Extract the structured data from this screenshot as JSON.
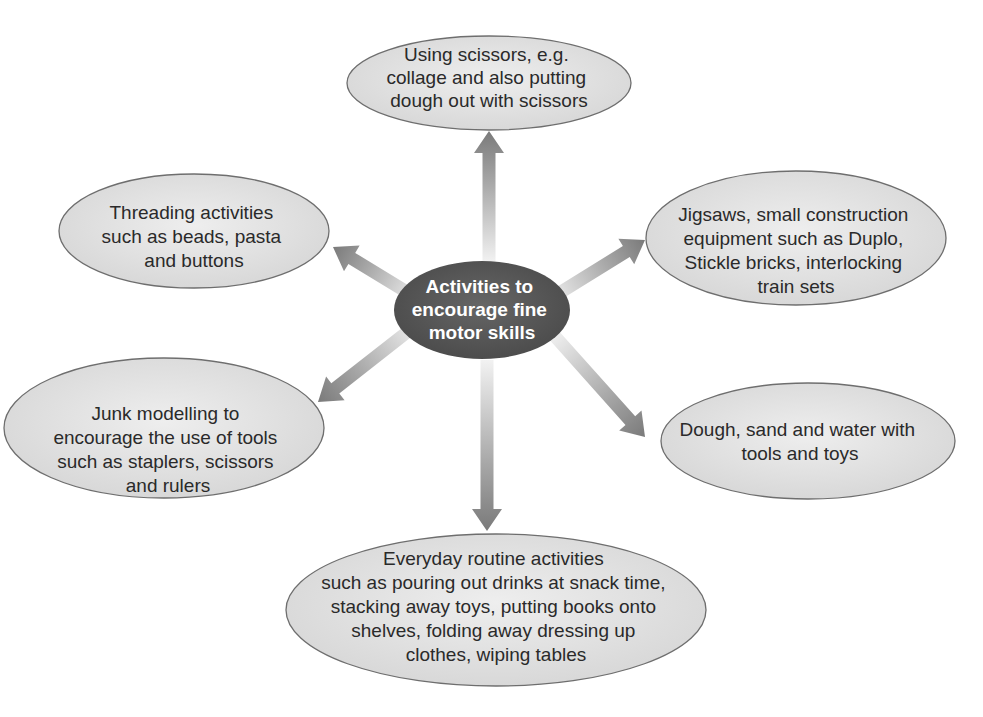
{
  "diagram": {
    "type": "spider-diagram",
    "center": {
      "label_lines": [
        "Activities to",
        "encourage fine",
        "motor skills"
      ],
      "color": "#5a5a5a"
    },
    "nodes": [
      {
        "id": "scissors",
        "direction": "up",
        "label_lines": [
          "Using scissors, e.g.",
          "collage and also putting",
          "dough out with scissors"
        ]
      },
      {
        "id": "threading",
        "direction": "upper-left",
        "label_lines": [
          "Threading activities",
          "such as beads, pasta",
          "and buttons"
        ]
      },
      {
        "id": "jigsaws",
        "direction": "upper-right",
        "label_lines": [
          "Jigsaws, small construction",
          "equipment such as Duplo,",
          "Stickle bricks, interlocking",
          "train sets"
        ]
      },
      {
        "id": "junk-modelling",
        "direction": "lower-left",
        "label_lines": [
          "Junk modelling to",
          "encourage the use of tools",
          "such as staplers, scissors",
          "and rulers"
        ]
      },
      {
        "id": "dough-sand-water",
        "direction": "lower-right",
        "label_lines": [
          "Dough, sand and water with",
          "tools and toys"
        ]
      },
      {
        "id": "everyday-routine",
        "direction": "down",
        "label_lines": [
          "Everyday routine activities",
          "such as pouring out drinks at snack time,",
          "stacking away toys, putting books onto",
          "shelves, folding away dressing up",
          "clothes, wiping tables"
        ]
      }
    ],
    "colors": {
      "node_fill": "#e2e2e2",
      "node_stroke": "#6e6e6e",
      "arrow": "#7a7a7a",
      "text": "#2a2a2a",
      "center_text": "#ffffff"
    }
  }
}
